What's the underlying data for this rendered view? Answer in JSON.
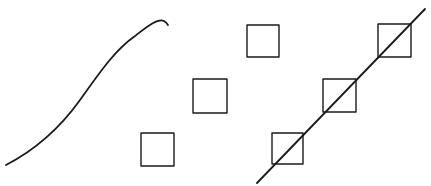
{
  "diagram": {
    "background": "#ffffff",
    "stroke_color": "#1a1a1a",
    "curve": {
      "label": "s-curve",
      "path": "M 6 165 C 35 150, 60 128, 80 100 C 100 72, 115 50, 135 36 C 148 26, 158 18, 164 21 Q 167 23, 168 25",
      "stroke_width": 1.8
    },
    "free_squares": [
      {
        "x": 141,
        "y": 133,
        "size": 33
      },
      {
        "x": 193,
        "y": 79,
        "size": 34
      },
      {
        "x": 247,
        "y": 25,
        "size": 32
      }
    ],
    "aligned_squares": [
      {
        "x": 272,
        "y": 133,
        "size": 31
      },
      {
        "x": 323,
        "y": 79,
        "size": 33
      },
      {
        "x": 378,
        "y": 24,
        "size": 33
      }
    ],
    "square_stroke_width": 1.4,
    "diagonal_line": {
      "x1": 257,
      "y1": 183,
      "x2": 425,
      "y2": 9,
      "stroke_width": 1.8
    }
  }
}
